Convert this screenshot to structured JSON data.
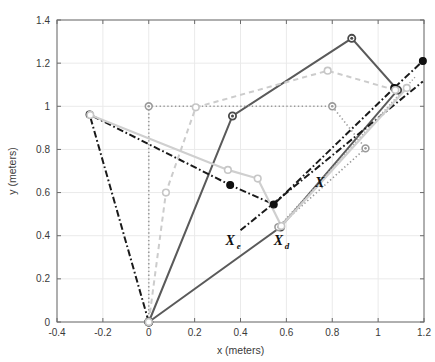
{
  "chart_data": {
    "type": "line",
    "title": "",
    "xlabel": "x (meters)",
    "ylabel": "y (meters)",
    "xlim": [
      -0.4,
      1.2
    ],
    "ylim": [
      0,
      1.4
    ],
    "xticks": [
      "-0.4",
      "-0.2",
      "0",
      "0.2",
      "0.4",
      "0.6",
      "0.8",
      "1",
      "1.2"
    ],
    "xtick_values": [
      -0.4,
      -0.2,
      0,
      0.2,
      0.4,
      0.6,
      0.8,
      1.0,
      1.2
    ],
    "yticks": [
      "0",
      "0.2",
      "0.4",
      "0.6",
      "0.8",
      "1",
      "1.2",
      "1.4"
    ],
    "ytick_values": [
      0,
      0.2,
      0.4,
      0.6,
      0.8,
      1.0,
      1.2,
      1.4
    ],
    "grid": true,
    "legend": "none",
    "colors": {
      "dark_gray": "#5a5a5a",
      "black": "#1a1a1a",
      "light_gray": "#c8c8c8",
      "mid_gray": "#9a9a9a",
      "axis": "#6b6b6b",
      "grid": "#eaeaea",
      "background": "#ffffff"
    },
    "annotations": [
      {
        "id": "annot-x-e",
        "base": "ℰ",
        "glyph": "X",
        "sub": "e",
        "x": 0.355,
        "y": 0.355
      },
      {
        "id": "annot-x-d",
        "base": "ℰ",
        "glyph": "X",
        "sub": "d",
        "x": 0.565,
        "y": 0.355
      },
      {
        "id": "annot-x",
        "base": "ℰ",
        "glyph": "X",
        "sub": "",
        "x": 0.745,
        "y": 0.625
      }
    ],
    "series": [
      {
        "name": "solid-dark-gray-chain",
        "style": "solid",
        "color": "#5a5a5a",
        "width": 2.0,
        "marker": "circle-open-dark",
        "points": [
          [
            0.0,
            0.0
          ],
          [
            0.365,
            0.955
          ],
          [
            0.885,
            1.315
          ],
          [
            1.085,
            1.075
          ],
          [
            0.575,
            0.44
          ],
          [
            0.0,
            0.0
          ]
        ]
      },
      {
        "name": "black-dashdot-chain",
        "style": "dashdot",
        "color": "#1a1a1a",
        "width": 2.0,
        "marker": "circle-filled-black",
        "points": [
          [
            0.0,
            0.0
          ],
          [
            -0.258,
            0.962
          ],
          [
            0.355,
            0.635
          ],
          [
            0.545,
            0.545
          ],
          [
            1.07,
            1.085
          ],
          [
            1.195,
            1.21
          ]
        ]
      },
      {
        "name": "black-dashdot-lower-ray",
        "style": "dashdot",
        "color": "#1a1a1a",
        "width": 2.0,
        "marker": "none",
        "points": [
          [
            0.4,
            0.425
          ],
          [
            1.195,
            1.115
          ]
        ]
      },
      {
        "name": "light-gray-dotted-chain",
        "style": "dotted",
        "color": "#9a9a9a",
        "width": 1.6,
        "marker": "circle-open-gray",
        "points": [
          [
            0.0,
            0.0
          ],
          [
            0.0,
            1.0
          ],
          [
            0.8,
            1.0
          ],
          [
            0.945,
            0.805
          ],
          [
            0.565,
            0.44
          ]
        ]
      },
      {
        "name": "light-gray-dotted-ray",
        "style": "dotted",
        "color": "#9a9a9a",
        "width": 1.4,
        "marker": "none",
        "points": [
          [
            0.565,
            0.44
          ],
          [
            1.165,
            1.14
          ]
        ]
      },
      {
        "name": "light-gray-dashed-chain",
        "style": "dashed",
        "color": "#cccccc",
        "width": 2.0,
        "marker": "circle-open-lightgray",
        "points": [
          [
            0.0,
            0.0
          ],
          [
            0.075,
            0.6
          ],
          [
            0.205,
            0.995
          ],
          [
            0.78,
            1.165
          ],
          [
            1.075,
            1.075
          ]
        ]
      },
      {
        "name": "light-gray-solid-chain",
        "style": "solid",
        "color": "#cfcfcf",
        "width": 2.2,
        "marker": "circle-open-lightgray",
        "points": [
          [
            -0.255,
            0.96
          ],
          [
            0.345,
            0.705
          ],
          [
            0.475,
            0.665
          ],
          [
            0.578,
            0.445
          ],
          [
            1.125,
            1.085
          ]
        ]
      }
    ]
  }
}
